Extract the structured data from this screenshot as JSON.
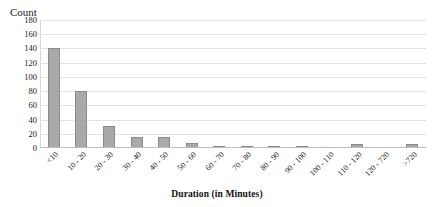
{
  "chart_data": {
    "type": "bar",
    "title": "",
    "xlabel": "Duration  (in Minutes)",
    "ylabel": "Count",
    "ylim": [
      0,
      180
    ],
    "ytick_step": 20,
    "yticks": [
      180,
      160,
      140,
      120,
      100,
      80,
      60,
      40,
      20,
      0
    ],
    "grid": true,
    "legend": false,
    "bar_color": "#a9a9a9",
    "bar_border_color": "#8a8a8a",
    "gridline_color": "#e3e3e3",
    "categories": [
      "<10",
      "10 - 20",
      "20 - 30",
      "30 - 40",
      "40 - 50",
      "50 - 60",
      "60 - 70",
      "70 - 80",
      "80 - 90",
      "90 - 100",
      "100 - 110",
      "110 - 120",
      "120 - 720",
      ">720"
    ],
    "values": [
      140,
      80,
      31,
      15,
      15,
      7,
      2,
      3,
      3,
      3,
      0,
      6,
      0,
      6
    ]
  }
}
